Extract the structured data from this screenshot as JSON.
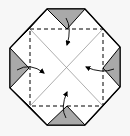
{
  "diagram": {
    "type": "origami-fold-step",
    "colors": {
      "background": "#f7f7f7",
      "paper_front": "#ffffff",
      "paper_back": "#a9a9a9",
      "outline": "#000000",
      "crease": "#8a8a8a"
    },
    "arrows": [
      {
        "from": "top",
        "direction": "down"
      },
      {
        "from": "left",
        "direction": "right"
      },
      {
        "from": "right",
        "direction": "left"
      },
      {
        "from": "bottom",
        "direction": "up"
      }
    ]
  }
}
